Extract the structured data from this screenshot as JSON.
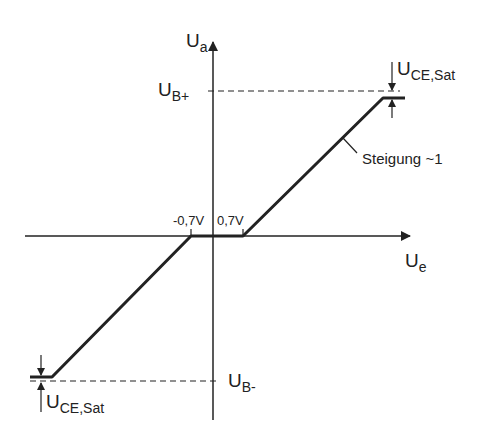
{
  "diagram": {
    "type": "transfer-characteristic",
    "axes": {
      "y_label_main": "U",
      "y_label_sub": "a",
      "x_label_main": "U",
      "x_label_sub": "e"
    },
    "levels": {
      "positive_main": "U",
      "positive_sub": "B+",
      "negative_main": "U",
      "negative_sub": "B-"
    },
    "thresholds": {
      "negative": "-0,7V",
      "positive": "0,7V"
    },
    "saturation_top": {
      "main": "U",
      "sub": "CE,Sat"
    },
    "saturation_bottom": {
      "main": "U",
      "sub": "CE,Sat"
    },
    "slope_annotation": "Steigung ~1",
    "line_color": "#222222"
  }
}
